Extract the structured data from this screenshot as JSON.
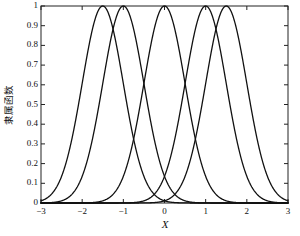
{
  "chart_data": {
    "type": "line",
    "title": "",
    "xlabel": "X",
    "ylabel": "隶属函数",
    "xlim": [
      -3,
      3
    ],
    "ylim": [
      0,
      1
    ],
    "xticks": [
      -3,
      -2,
      -1,
      0,
      1,
      2,
      3
    ],
    "xtick_labels": [
      "−3",
      "−2",
      "−1",
      "0",
      "1",
      "2",
      "3"
    ],
    "yticks": [
      0,
      0.1,
      0.2,
      0.3,
      0.4,
      0.5,
      0.6,
      0.7,
      0.8,
      0.9,
      1
    ],
    "ytick_labels": [
      "0",
      "0.1",
      "0.2",
      "0.3",
      "0.4",
      "0.5",
      "0.6",
      "0.7",
      "0.8",
      "0.9",
      "1"
    ],
    "grid": false,
    "legend": "none",
    "line_color": "#111111",
    "line_width": 1.3,
    "curve_kind": "gaussian",
    "series": [
      {
        "name": "mf1",
        "center": -1.5,
        "sigma": 0.5,
        "peak": 1
      },
      {
        "name": "mf2",
        "center": -1.0,
        "sigma": 0.5,
        "peak": 1
      },
      {
        "name": "mf3",
        "center": 0.0,
        "sigma": 0.5,
        "peak": 1
      },
      {
        "name": "mf4",
        "center": 1.0,
        "sigma": 0.5,
        "peak": 1
      },
      {
        "name": "mf5",
        "center": 1.5,
        "sigma": 0.5,
        "peak": 1
      }
    ]
  },
  "figure": {
    "background": "#ffffff",
    "axis_color": "#222222"
  }
}
